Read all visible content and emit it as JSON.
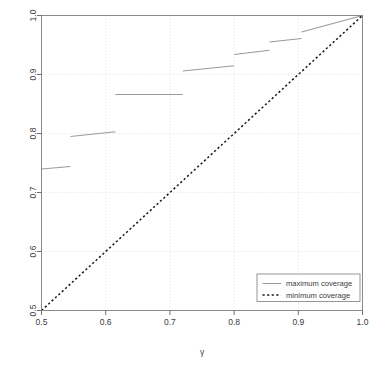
{
  "chart_data": {
    "type": "line",
    "title": "",
    "subtitle": "",
    "xlabel": "γ",
    "ylabel": "",
    "xlim": [
      0.5,
      1.0
    ],
    "ylim": [
      0.5,
      1.0
    ],
    "grid": true,
    "grid_style": "dotted",
    "grid_color": "#d9d9d9",
    "background": "#ffffff",
    "box": true,
    "xticks": [
      0.5,
      0.6,
      0.7,
      0.8,
      0.9,
      1.0
    ],
    "xtick_labels": [
      "0.5",
      "0.6",
      "0.7",
      "0.8",
      "0.9",
      "1.0"
    ],
    "yticks": [
      0.5,
      0.6,
      0.7,
      0.8,
      0.9,
      1.0
    ],
    "ytick_labels": [
      "0.5",
      "0.6",
      "0.7",
      "0.8",
      "0.9",
      "1.0"
    ],
    "legend": {
      "position": "bottom-right",
      "entries": [
        {
          "label": "maximum coverage",
          "style": "solid",
          "color": "#9a9a9a"
        },
        {
          "label": "minimum coverage",
          "style": "dashed",
          "color": "#1a1a1a"
        }
      ]
    },
    "series": [
      {
        "name": "maximum coverage",
        "style": "solid",
        "color": "#9a9a9a",
        "type": "step-segments",
        "segments": [
          {
            "x0": 0.5,
            "y0": 0.74,
            "x1": 0.545,
            "y1": 0.744
          },
          {
            "x0": 0.545,
            "y0": 0.795,
            "x1": 0.615,
            "y1": 0.803
          },
          {
            "x0": 0.615,
            "y0": 0.866,
            "x1": 0.72,
            "y1": 0.866
          },
          {
            "x0": 0.72,
            "y0": 0.906,
            "x1": 0.8,
            "y1": 0.915
          },
          {
            "x0": 0.8,
            "y0": 0.934,
            "x1": 0.855,
            "y1": 0.941
          },
          {
            "x0": 0.855,
            "y0": 0.955,
            "x1": 0.905,
            "y1": 0.961
          },
          {
            "x0": 0.905,
            "y0": 0.972,
            "x1": 1.0,
            "y1": 1.0
          }
        ]
      },
      {
        "name": "minimum coverage",
        "style": "dashed",
        "color": "#1a1a1a",
        "type": "line",
        "x": [
          0.5,
          1.0
        ],
        "y": [
          0.5,
          1.0
        ]
      }
    ]
  }
}
